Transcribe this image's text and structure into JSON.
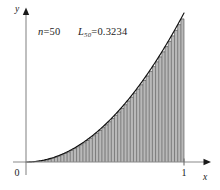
{
  "figure": {
    "background_color": "#ffffff",
    "width": 220,
    "height": 190
  },
  "annotations": {
    "n_variable": "n",
    "n_equals": "=",
    "n_value": "50",
    "sum_symbol": "L",
    "sum_subscript": "50",
    "sum_equals": "=",
    "sum_value": "0.3234"
  },
  "axes": {
    "x_label": "x",
    "y_label": "y",
    "origin_label": "0",
    "x_ticks": [
      {
        "label": "1",
        "value": 1
      }
    ],
    "y_ticks": [],
    "x_range": [
      0,
      1
    ],
    "y_range": [
      0,
      1
    ],
    "axis_color": "#8a8a8a",
    "arrow_color": "#1a1a1a"
  },
  "chart_data": {
    "type": "bar",
    "title": "",
    "subtitle": "",
    "xlabel": "x",
    "ylabel": "y",
    "xlim": [
      0,
      1
    ],
    "ylim": [
      0,
      1
    ],
    "grid": false,
    "legend": "none",
    "n_rectangles": 50,
    "rule": "left-endpoint",
    "approximation_label": "L_50",
    "approximation_value": 0.3234,
    "exact_value": 0.3333,
    "function_expression": "x^2",
    "bar_fill_color": "#b9b9b9",
    "bar_edge_color": "#3c3c3c",
    "curve_color": "#111111",
    "categories": [
      "0.00",
      "0.02",
      "0.04",
      "0.06",
      "0.08",
      "0.10",
      "0.12",
      "0.14",
      "0.16",
      "0.18",
      "0.20",
      "0.22",
      "0.24",
      "0.26",
      "0.28",
      "0.30",
      "0.32",
      "0.34",
      "0.36",
      "0.38",
      "0.40",
      "0.42",
      "0.44",
      "0.46",
      "0.48",
      "0.50",
      "0.52",
      "0.54",
      "0.56",
      "0.58",
      "0.60",
      "0.62",
      "0.64",
      "0.66",
      "0.68",
      "0.70",
      "0.72",
      "0.74",
      "0.76",
      "0.78",
      "0.80",
      "0.82",
      "0.84",
      "0.86",
      "0.88",
      "0.90",
      "0.92",
      "0.94",
      "0.96",
      "0.98"
    ],
    "values": [
      0.0,
      0.0004,
      0.0016,
      0.0036,
      0.0064,
      0.01,
      0.0144,
      0.0196,
      0.0256,
      0.0324,
      0.04,
      0.0484,
      0.0576,
      0.0676,
      0.0784,
      0.09,
      0.1024,
      0.1156,
      0.1296,
      0.1444,
      0.16,
      0.1764,
      0.1936,
      0.2116,
      0.2304,
      0.25,
      0.2704,
      0.2916,
      0.3136,
      0.3364,
      0.36,
      0.3844,
      0.4096,
      0.4356,
      0.4624,
      0.49,
      0.5184,
      0.5476,
      0.5776,
      0.6084,
      0.64,
      0.6724,
      0.7056,
      0.7396,
      0.7744,
      0.81,
      0.8464,
      0.8836,
      0.9216,
      0.9604
    ],
    "series": [
      {
        "name": "curve f(x) = x^2",
        "type": "line",
        "x": [
          0.0,
          0.05,
          0.1,
          0.15,
          0.2,
          0.25,
          0.3,
          0.35,
          0.4,
          0.45,
          0.5,
          0.55,
          0.6,
          0.65,
          0.7,
          0.75,
          0.8,
          0.85,
          0.9,
          0.95,
          1.0
        ],
        "y": [
          0.0,
          0.0025,
          0.01,
          0.0225,
          0.04,
          0.0625,
          0.09,
          0.1225,
          0.16,
          0.2025,
          0.25,
          0.3025,
          0.36,
          0.4225,
          0.49,
          0.5625,
          0.64,
          0.7225,
          0.81,
          0.9025,
          1.0
        ]
      }
    ]
  }
}
